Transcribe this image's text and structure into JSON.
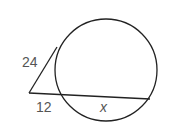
{
  "diagram": {
    "type": "circle with tangent and secant from external point",
    "labels": {
      "tangent": "24",
      "external_secant": "12",
      "internal_secant": "x"
    },
    "colors": {
      "stroke": "#222222",
      "label": "#555555",
      "background": "#ffffff"
    }
  }
}
